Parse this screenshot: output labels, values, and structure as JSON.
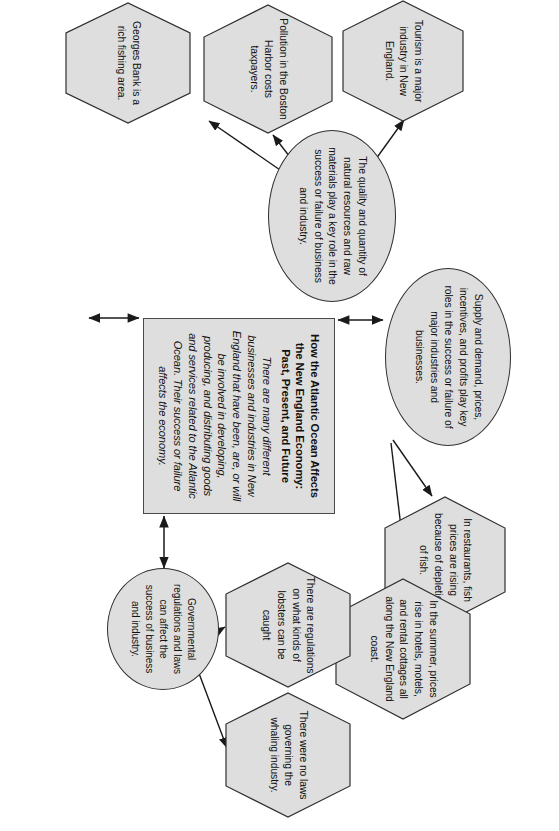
{
  "diagram": {
    "type": "concept-map",
    "orientation": "rotated-90-clockwise",
    "palette": {
      "node_fill": "#dedede",
      "node_stroke": "#2f2f2f",
      "edge_stroke": "#1a1a1a",
      "page_background": "#ffffff",
      "text": "#111111"
    },
    "center": {
      "shape": "rectangle",
      "title": "How the Atlantic Ocean Affects the New England Economy: Past, Present, and Future",
      "body": "There are many different businesses and industries in New England that have been, are, or will be involved in developing, producing, and distributing goods and services related to the Atlantic Ocean. Their success or failure affects the economy."
    },
    "branches": [
      {
        "id": "supply-demand",
        "shape": "ellipse",
        "text": "Supply and demand, prices, incentives, and profits play key roles in the success or failure of major industries and businesses.",
        "examples": [
          {
            "id": "fish-prices",
            "shape": "hexagon",
            "text": "In restaurants, fish prices are rising because of depletion of fish."
          },
          {
            "id": "summer-lodging-prices",
            "shape": "hexagon",
            "text": "In the summer, prices rise in hotels, motels, and rental cottages all along the New England coast."
          }
        ]
      },
      {
        "id": "government-regulation",
        "shape": "ellipse",
        "text": "Governmental regulations and laws can affect the success of business and industry.",
        "examples": [
          {
            "id": "lobster-regulations",
            "shape": "hexagon",
            "text": "There are regulations on what kinds of lobsters can be caught"
          },
          {
            "id": "whaling-laws",
            "shape": "hexagon",
            "text": "There were no laws governing the whaling industry."
          }
        ]
      },
      {
        "id": "natural-resources",
        "shape": "ellipse",
        "text": "The quality and quantity of natural resources and raw materials play a key role in the success or failure of business and industry.",
        "examples": [
          {
            "id": "tourism",
            "shape": "hexagon",
            "text": "Tourism is a major industry in New England."
          },
          {
            "id": "boston-harbor-pollution",
            "shape": "hexagon",
            "text": "Pollution in the Boston Harbor costs taxpayers."
          },
          {
            "id": "georges-bank",
            "shape": "hexagon",
            "text": "Georges Bank is a rich fishing area."
          }
        ]
      }
    ],
    "connectors": [
      {
        "id": "center-to-supply",
        "from": "center",
        "to": "supply-demand",
        "arrow": "double"
      },
      {
        "id": "center-to-government",
        "from": "center",
        "to": "government-regulation",
        "arrow": "double"
      },
      {
        "id": "center-to-resources",
        "from": "center",
        "to": "natural-resources",
        "arrow": "double"
      },
      {
        "id": "supply-to-fish-prices",
        "from": "supply-demand",
        "to": "fish-prices",
        "arrow": "single"
      },
      {
        "id": "supply-to-lodging",
        "from": "supply-demand",
        "to": "summer-lodging-prices",
        "arrow": "single"
      },
      {
        "id": "government-to-lobster",
        "from": "government-regulation",
        "to": "lobster-regulations",
        "arrow": "single"
      },
      {
        "id": "government-to-whaling",
        "from": "government-regulation",
        "to": "whaling-laws",
        "arrow": "single"
      },
      {
        "id": "resources-to-tourism",
        "from": "natural-resources",
        "to": "tourism",
        "arrow": "single"
      },
      {
        "id": "resources-to-pollution",
        "from": "natural-resources",
        "to": "boston-harbor-pollution",
        "arrow": "single"
      },
      {
        "id": "resources-to-georges-bank",
        "from": "natural-resources",
        "to": "georges-bank",
        "arrow": "single"
      }
    ]
  }
}
